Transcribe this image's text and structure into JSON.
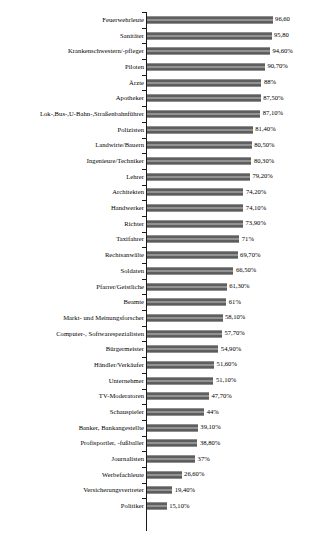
{
  "chart_data": {
    "type": "bar",
    "orientation": "horizontal",
    "title": "",
    "subtitle": "",
    "xlabel": "",
    "ylabel": "",
    "xlim": [
      0,
      100
    ],
    "grid": false,
    "legend": false,
    "value_suffix": "%",
    "decimal_separator": ",",
    "bar_color": "#8e8e8e",
    "axis_color": "#1a1a1a",
    "text_color": "#000000",
    "background_color": "#ffffff",
    "categories": [
      "Feuerwehrleute",
      "Sanitäter",
      "Krankenschwestern/-pfleger",
      "Piloten",
      "Ärzte",
      "Apotheker",
      "Lok-,Bus-,U-Bahn-,Straßenbahnführer",
      "Polizisten",
      "Landwirte/Bauern",
      "Ingenieure/Techniker",
      "Lehrer",
      "Architekten",
      "Handwerker",
      "Richter",
      "Taxifahrer",
      "Rechtsanwälte",
      "Soldaten",
      "Pfarrer/Geistliche",
      "Beamte",
      "Markt- und Meinungsforscher",
      "Computer-, Softwarespezialisten",
      "Bürgermeister",
      "Händler/Verkäufer",
      "Unternehmer",
      "TV-Moderatoren",
      "Schauspieler",
      "Banker, Bankangestellte",
      "Profisportler, -fußballer",
      "Journalisten",
      "Werbefachleute",
      "Versicherungsvertreter",
      "Politiker"
    ],
    "values": [
      96.6,
      95.8,
      94.6,
      90.7,
      88.0,
      87.5,
      87.1,
      81.4,
      80.5,
      80.3,
      79.2,
      74.2,
      74.1,
      73.9,
      71.0,
      69.7,
      66.5,
      61.3,
      61.0,
      58.1,
      57.7,
      54.9,
      51.6,
      51.1,
      47.7,
      44.0,
      39.1,
      38.8,
      37.0,
      26.6,
      19.4,
      15.1
    ],
    "value_labels": [
      "96,60",
      "95,80",
      "94,60%",
      "90,70%",
      "88%",
      "87,50%",
      "87,10%",
      "81,40%",
      "80,50%",
      "80,30%",
      "79,20%",
      "74,20%",
      "74,10%",
      "73,90%",
      "71%",
      "69,70%",
      "66,50%",
      "61,30%",
      "61%",
      "58,10%",
      "57,70%",
      "54,90%",
      "51,60%",
      "51,10%",
      "47,70%",
      "44%",
      "39,10%",
      "38,80%",
      "37%",
      "26,60%",
      "19,40%",
      "15,10%"
    ]
  }
}
